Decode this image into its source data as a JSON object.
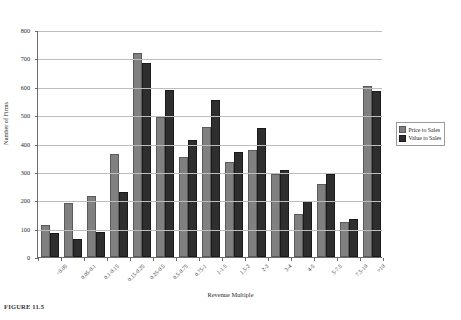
{
  "figure": {
    "caption": "FIGURE 11.5"
  },
  "legend": {
    "position": "right",
    "entries": [
      {
        "label": "Price to Sales",
        "color": "#808080",
        "swatch": "gray"
      },
      {
        "label": "Value to Sales",
        "color": "#2e2e2e",
        "swatch": "dark"
      }
    ]
  },
  "chart_data": {
    "type": "bar",
    "title": "",
    "xlabel": "Revenue Multiple",
    "ylabel": "Number of Firms",
    "ylim": [
      0,
      800
    ],
    "ytick_step": 100,
    "yticks": [
      0,
      100,
      200,
      300,
      400,
      500,
      600,
      700,
      800
    ],
    "ytick_labels": [
      "0",
      "100",
      "200",
      "300",
      "400",
      "500",
      "600",
      "700",
      "800"
    ],
    "grid": true,
    "grid_axis": "y",
    "legend_position": "right",
    "categories": [
      "<0.05",
      "0.05-0.1",
      "0.1-0.15",
      "0.15-0.25",
      "0.25-0.5",
      "0.5-0.75",
      "0.75-1",
      "1-1.5",
      "1.5-2",
      "2-3",
      "3-4",
      "4-5",
      "5-7.5",
      "7.5-10",
      ">10"
    ],
    "series": [
      {
        "name": "Price to Sales",
        "color": "#808080",
        "values": [
          105,
          183,
          207,
          357,
          712,
          486,
          347,
          452,
          329,
          369,
          284,
          143,
          252,
          115,
          595
        ]
      },
      {
        "name": "Value to Sales",
        "color": "#2e2e2e",
        "values": [
          78,
          57,
          80,
          222,
          675,
          580,
          407,
          545,
          362,
          446,
          298,
          192,
          284,
          126,
          578
        ]
      }
    ]
  }
}
